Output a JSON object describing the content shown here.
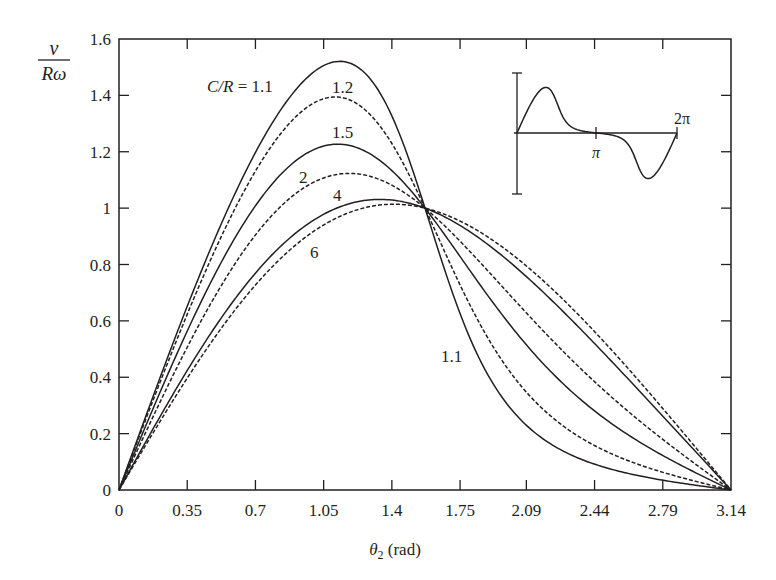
{
  "chart_data": {
    "type": "line",
    "title": "",
    "xlabel": "θ2 (rad)",
    "xlabel_main": "θ",
    "xlabel_sub": "2",
    "xlabel_unit": " (rad)",
    "ylabel_numerator": "ν",
    "ylabel_denominator": "Rω",
    "xlim": [
      0,
      3.14
    ],
    "ylim": [
      0,
      1.6
    ],
    "grid": false,
    "xticks": [
      "0",
      "0.35",
      "0.7",
      "1.05",
      "1.4",
      "1.75",
      "2.09",
      "2.44",
      "2.79",
      "3.14"
    ],
    "yticks": [
      "0",
      "0.2",
      "0.4",
      "0.6",
      "0.8",
      "1",
      "1.2",
      "1.4",
      "1.6"
    ],
    "x": [
      0,
      0.35,
      0.7,
      1.05,
      1.4,
      1.75,
      2.09,
      2.44,
      2.79,
      3.14
    ],
    "series": [
      {
        "name": "C/R = 1.1",
        "ratio": 1.1,
        "style": "solid",
        "values": [
          0,
          0.657,
          1.199,
          1.499,
          1.34,
          0.615,
          0.233,
          0.09,
          0.03,
          0
        ]
      },
      {
        "name": "C/R = 1.2",
        "ratio": 1.2,
        "style": "dashed",
        "values": [
          0,
          0.623,
          1.131,
          1.387,
          1.229,
          0.73,
          0.346,
          0.158,
          0.063,
          0
        ]
      },
      {
        "name": "C/R = 1.5",
        "ratio": 1.5,
        "style": "solid",
        "values": [
          0,
          0.564,
          1.008,
          1.219,
          1.133,
          0.83,
          0.515,
          0.281,
          0.123,
          0
        ]
      },
      {
        "name": "C/R = 2",
        "ratio": 2,
        "style": "dashed",
        "values": [
          0,
          0.506,
          0.904,
          1.106,
          1.081,
          0.883,
          0.628,
          0.385,
          0.18,
          0
        ]
      },
      {
        "name": "C/R = 4",
        "ratio": 4,
        "style": "solid",
        "values": [
          0,
          0.424,
          0.769,
          0.977,
          1.028,
          0.939,
          0.757,
          0.52,
          0.263,
          0
        ]
      },
      {
        "name": "C/R = 6",
        "ratio": 6,
        "style": "dashed",
        "values": [
          0,
          0.397,
          0.727,
          0.94,
          1.013,
          0.954,
          0.795,
          0.563,
          0.29,
          0
        ]
      }
    ],
    "annotations": [
      {
        "text": "C/R = 1.1",
        "x_px": 207,
        "y_px": 92
      },
      {
        "text": "1.2",
        "x_px": 333,
        "y_px": 93
      },
      {
        "text": "1.5",
        "x_px": 333,
        "y_px": 138
      },
      {
        "text": "2",
        "x_px": 300,
        "y_px": 183
      },
      {
        "text": "4",
        "x_px": 333,
        "y_px": 201
      },
      {
        "text": "6",
        "x_px": 310,
        "y_px": 258
      },
      {
        "text": "1.1",
        "x_px": 441,
        "y_px": 362
      }
    ],
    "inset": {
      "description": "Full-cycle velocity curve from 0 to 2π",
      "tick_labels": [
        "π",
        "2π"
      ],
      "x_range": [
        0,
        6.283
      ]
    }
  },
  "labels": {
    "cr_prefix": "C/R",
    "cr_eq": " = 1.1",
    "l12": "1.2",
    "l15": "1.5",
    "l2": "2",
    "l4": "4",
    "l6": "6",
    "l11b": "1.1",
    "inset_pi": "π",
    "inset_2pi": "2π",
    "ylab_num": "ν",
    "ylab_den": "Rω",
    "xlab_theta": "θ",
    "xlab_sub": "2",
    "xlab_unit": " (rad)"
  },
  "colors": {
    "line": "#231f20",
    "background": "#ffffff"
  }
}
